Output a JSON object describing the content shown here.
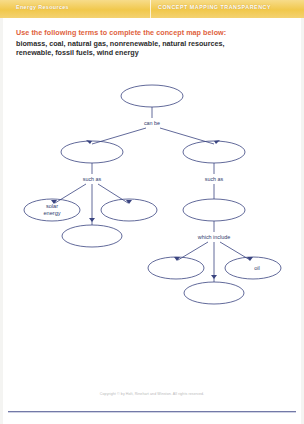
{
  "header": {
    "left_title": "Energy Resources",
    "right_title": "CONCEPT MAPPING TRANSPARENCY",
    "band_color": "#f1c84c"
  },
  "instruction": {
    "text": "Use the following terms to complete the concept map below:",
    "color": "#e0613c"
  },
  "word_bank": {
    "line1": "biomass, coal, natural gas, nonrenewable, natural resources,",
    "line2": "renewable, fossil fuels, wind energy",
    "terms": [
      "biomass",
      "coal",
      "natural gas",
      "nonrenewable",
      "natural resources",
      "renewable",
      "fossil fuels",
      "wind energy"
    ]
  },
  "concept_map": {
    "ink_color": "#3a4480",
    "nodes": {
      "root": "",
      "left_branch": "",
      "right_branch": "",
      "left_child_a": "solar energy",
      "left_child_b": "",
      "left_child_c": "",
      "right_child_parent": "",
      "right_child_a": "",
      "right_child_b": "oil",
      "right_child_c": ""
    },
    "node_labels": {
      "solar_energy_line1": "solar",
      "solar_energy_line2": "energy",
      "oil": "oil"
    },
    "connectors": {
      "can_be": "can be",
      "such_as_left": "such as",
      "such_as_right": "such as",
      "which_include": "which include"
    }
  },
  "footer": {
    "copyright": "Copyright © by Holt, Rinehart and Winston. All rights reserved."
  }
}
